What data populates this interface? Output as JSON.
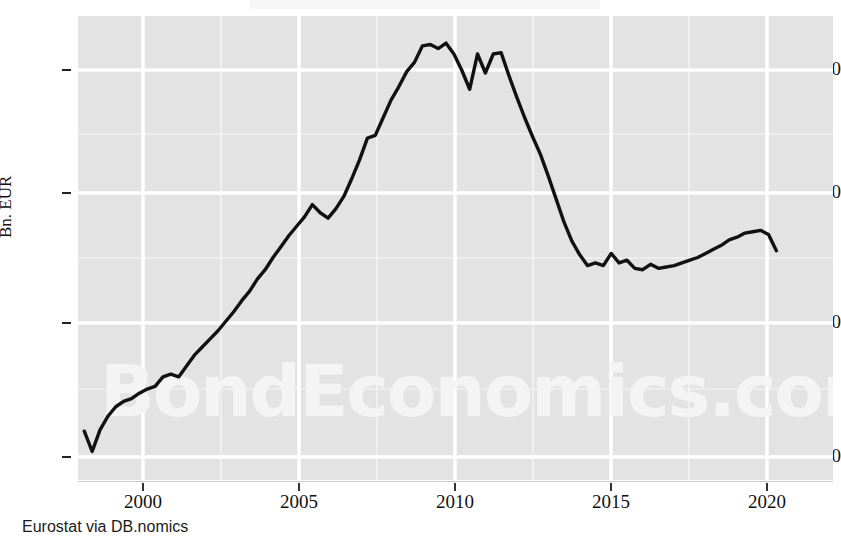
{
  "footer": {
    "source": "Eurostat via DB.nomics"
  },
  "watermark": {
    "text": "BondEconomics.com"
  },
  "axes": {
    "ylabel": "Bn. EUR",
    "yticks": [
      "30",
      "40",
      "50",
      "60"
    ],
    "xticks": [
      "2000",
      "2005",
      "2010",
      "2015",
      "2020"
    ]
  },
  "colors": {
    "plot_background": "#e3e3e3",
    "gridline": "#ffffff",
    "series_line": "#111111",
    "text": "#111111",
    "watermark": "#f5f5f5"
  },
  "chart_data": {
    "type": "line",
    "title": "",
    "xlabel": "",
    "ylabel": "Bn. EUR",
    "xlim": [
      1997.8,
      2021.8
    ],
    "ylim": [
      28.6,
      62.8
    ],
    "xticks": [
      2000,
      2005,
      2010,
      2015,
      2020
    ],
    "yticks": [
      30,
      40,
      50,
      60
    ],
    "grid": true,
    "minor_grid": true,
    "legend": "none",
    "source": "Eurostat via DB.nomics",
    "series": [
      {
        "name": "Bn. EUR",
        "x": [
          1998.0,
          1998.25,
          1998.5,
          1998.75,
          1999.0,
          1999.25,
          1999.5,
          1999.75,
          2000.0,
          2000.25,
          2000.5,
          2000.75,
          2001.0,
          2001.25,
          2001.5,
          2001.75,
          2002.0,
          2002.25,
          2002.5,
          2002.75,
          2003.0,
          2003.25,
          2003.5,
          2003.75,
          2004.0,
          2004.25,
          2004.5,
          2004.75,
          2005.0,
          2005.25,
          2005.5,
          2005.75,
          2006.0,
          2006.25,
          2006.5,
          2006.75,
          2007.0,
          2007.25,
          2007.5,
          2007.75,
          2008.0,
          2008.25,
          2008.5,
          2008.75,
          2009.0,
          2009.25,
          2009.5,
          2009.75,
          2010.0,
          2010.25,
          2010.5,
          2010.75,
          2011.0,
          2011.25,
          2011.5,
          2011.75,
          2012.0,
          2012.25,
          2012.5,
          2012.75,
          2013.0,
          2013.25,
          2013.5,
          2013.75,
          2014.0,
          2014.25,
          2014.5,
          2014.75,
          2015.0,
          2015.25,
          2015.5,
          2015.75,
          2016.0,
          2016.25,
          2016.5,
          2016.75,
          2017.0,
          2017.25,
          2017.5,
          2017.75,
          2018.0,
          2018.25,
          2018.5,
          2018.75,
          2019.0,
          2019.25,
          2019.5,
          2019.75,
          2020.0
        ],
        "y": [
          32.2,
          30.7,
          32.3,
          33.3,
          34.0,
          34.4,
          34.6,
          35.0,
          35.3,
          35.5,
          36.2,
          36.4,
          36.2,
          37.0,
          37.8,
          38.4,
          39.0,
          39.6,
          40.3,
          41.0,
          41.8,
          42.5,
          43.4,
          44.1,
          45.0,
          45.8,
          46.6,
          47.3,
          48.0,
          48.9,
          48.3,
          47.9,
          48.6,
          49.5,
          50.8,
          52.2,
          53.8,
          54.0,
          55.3,
          56.6,
          57.6,
          58.7,
          59.4,
          60.6,
          60.7,
          60.4,
          60.8,
          60.0,
          58.8,
          57.4,
          60.0,
          58.6,
          60.0,
          60.1,
          58.4,
          56.8,
          55.3,
          53.9,
          52.6,
          51.0,
          49.3,
          47.6,
          46.2,
          45.2,
          44.4,
          44.6,
          44.4,
          45.3,
          44.6,
          44.8,
          44.2,
          44.1,
          44.5,
          44.2,
          44.3,
          44.4,
          44.6,
          44.8,
          45.0,
          45.3,
          45.6,
          45.9,
          46.3,
          46.5,
          46.8,
          46.9,
          47.0,
          46.7,
          45.5
        ]
      }
    ]
  }
}
